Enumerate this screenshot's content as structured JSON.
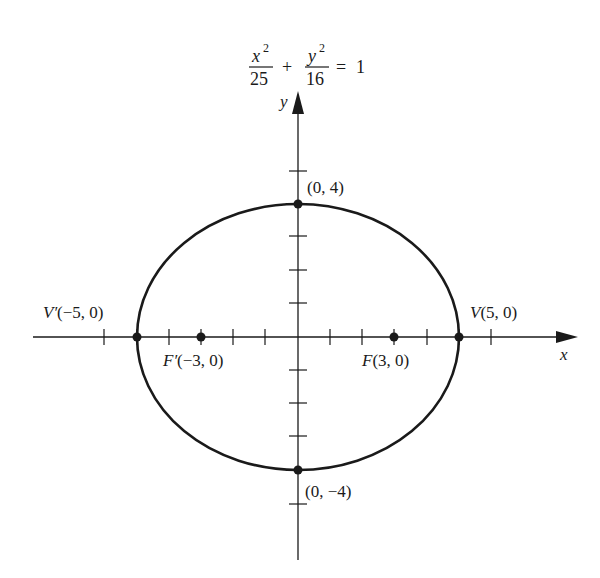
{
  "equation": {
    "x_num": "x",
    "x_exp": "2",
    "x_den": "25",
    "plus": "+",
    "y_num": "y",
    "y_exp": "2",
    "y_den": "16",
    "equals": "=",
    "rhs": "1"
  },
  "axes": {
    "x_label": "x",
    "y_label": "y"
  },
  "points": {
    "vertex_right": {
      "name": "V",
      "coords": "(5, 0)"
    },
    "vertex_left": {
      "name": "V′",
      "coords": "(−5, 0)"
    },
    "focus_right": {
      "name": "F",
      "coords": "(3, 0)"
    },
    "focus_left": {
      "name": "F′",
      "coords": "(−3, 0)"
    },
    "top": {
      "coords": "(0, 4)"
    },
    "bottom": {
      "coords": "(0, −4)"
    }
  },
  "geometry": {
    "a": 5,
    "b": 4,
    "c": 3,
    "x_ticks": [
      -6,
      -5,
      -4,
      -3,
      -2,
      -1,
      1,
      2,
      3,
      4,
      5,
      6
    ],
    "y_ticks": [
      -5,
      -4,
      -3,
      -2,
      -1,
      1,
      2,
      3,
      4,
      5
    ]
  },
  "colors": {
    "ink": "#1a1a1a",
    "background": "#ffffff"
  }
}
